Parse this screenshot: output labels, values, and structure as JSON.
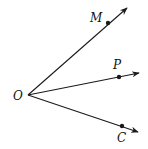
{
  "diagram": {
    "stroke_color": "#1a1a1a",
    "vertex": {
      "label": "O",
      "x": 28,
      "y": 95,
      "label_x": 13,
      "label_y": 100
    },
    "rays": [
      {
        "id": "OM",
        "point_label": "M",
        "point": {
          "x": 108,
          "y": 23
        },
        "tip": {
          "x": 127,
          "y": 8
        },
        "label_x": 90,
        "label_y": 22
      },
      {
        "id": "OP",
        "point_label": "P",
        "point": {
          "x": 119,
          "y": 77
        },
        "tip": {
          "x": 139,
          "y": 73
        },
        "label_x": 113,
        "label_y": 69
      },
      {
        "id": "OC",
        "point_label": "C",
        "point": {
          "x": 122,
          "y": 126
        },
        "tip": {
          "x": 138,
          "y": 132
        },
        "label_x": 117,
        "label_y": 142
      }
    ]
  }
}
